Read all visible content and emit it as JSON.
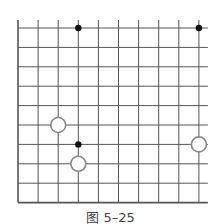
{
  "caption": "图 5–25",
  "board": {
    "columns": 10,
    "rows": 10,
    "x0": 18,
    "y0": 28,
    "dx": 20.1,
    "dy": 19.4,
    "extend_top": 8,
    "extend_right": 9,
    "line_color": "#555555",
    "edges": [
      "left",
      "bottom"
    ]
  },
  "stones": [
    {
      "color": "black",
      "col": 3,
      "row": 0
    },
    {
      "color": "black",
      "col": 9,
      "row": 0
    },
    {
      "color": "white",
      "col": 2,
      "row": 5
    },
    {
      "color": "black",
      "col": 3,
      "row": 6
    },
    {
      "color": "white",
      "col": 3,
      "row": 7
    },
    {
      "color": "white",
      "col": 9,
      "row": 6
    }
  ]
}
